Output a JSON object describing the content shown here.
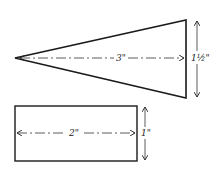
{
  "diagram": {
    "type": "technical-drawing",
    "colors": {
      "stroke": "#1a1a1a",
      "background": "#ffffff"
    },
    "shapes": [
      {
        "id": "triangle",
        "kind": "isosceles-triangle",
        "length_label": "3\"",
        "height_label": "1½\""
      },
      {
        "id": "rectangle",
        "kind": "rectangle",
        "width_label": "2\"",
        "height_label": "1\""
      }
    ]
  }
}
